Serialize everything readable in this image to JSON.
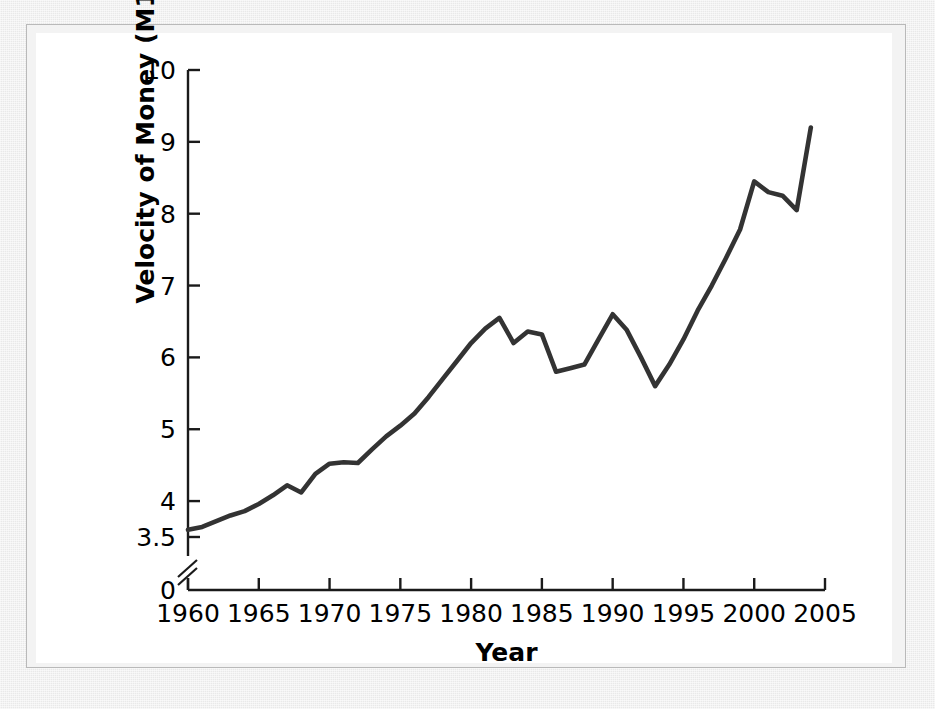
{
  "chart_data": {
    "type": "line",
    "title": "",
    "xlabel": "Year",
    "ylabel": "Velocity of Money (M1)",
    "xlim": [
      1960,
      2005
    ],
    "ylim": [
      3.5,
      10
    ],
    "y_axis_broken": true,
    "y_break_from": 0,
    "y_break_to": 3.5,
    "grid": false,
    "legend": "none",
    "line_color": "#333333",
    "xticks": [
      "1960",
      "1965",
      "1970",
      "1975",
      "1980",
      "1985",
      "1990",
      "1995",
      "2000",
      "2005"
    ],
    "xtick_values": [
      1960,
      1965,
      1970,
      1975,
      1980,
      1985,
      1990,
      1995,
      2000,
      2005
    ],
    "yticks": [
      "0",
      "3.5",
      "4",
      "5",
      "6",
      "7",
      "8",
      "9",
      "10"
    ],
    "ytick_values": [
      0,
      3.5,
      4,
      5,
      6,
      7,
      8,
      9,
      10
    ],
    "x": [
      1960,
      1961,
      1962,
      1963,
      1964,
      1965,
      1966,
      1967,
      1968,
      1969,
      1970,
      1971,
      1972,
      1973,
      1974,
      1975,
      1976,
      1977,
      1978,
      1979,
      1980,
      1981,
      1982,
      1983,
      1984,
      1985,
      1986,
      1987,
      1988,
      1989,
      1990,
      1991,
      1992,
      1993,
      1994,
      1995,
      1996,
      1997,
      1998,
      1999,
      2000,
      2001,
      2002,
      2003,
      2004
    ],
    "values": [
      3.6,
      3.64,
      3.72,
      3.8,
      3.86,
      3.96,
      4.08,
      4.22,
      4.12,
      4.38,
      4.52,
      4.54,
      4.53,
      4.72,
      4.9,
      5.05,
      5.22,
      5.45,
      5.7,
      5.95,
      6.2,
      6.4,
      6.55,
      6.2,
      6.36,
      6.32,
      5.8,
      5.85,
      5.9,
      6.25,
      6.6,
      6.38,
      6.0,
      5.6,
      5.9,
      6.25,
      6.65,
      7.0,
      7.38,
      7.78,
      8.45,
      8.3,
      8.25,
      8.05,
      9.2
    ],
    "series_name": "Velocity of Money (M1)"
  },
  "axis": {
    "x_title": "Year",
    "y_title": "Velocity of Money (M1)"
  }
}
